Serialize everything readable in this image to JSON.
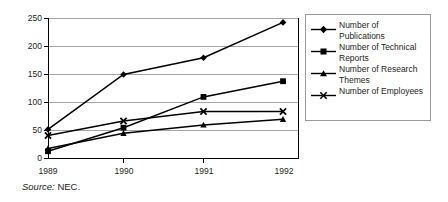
{
  "chart_data": {
    "type": "line",
    "title": "",
    "xlabel": "",
    "ylabel": "",
    "x": [
      "1989",
      "1990",
      "1991",
      "1992"
    ],
    "categories": [
      "1989",
      "1990",
      "1991",
      "1992"
    ],
    "ylim": [
      0,
      250
    ],
    "yticks": [
      0,
      50,
      100,
      150,
      200,
      250
    ],
    "ytick_labels": [
      "0",
      "50",
      "100",
      "150",
      "200",
      "250"
    ],
    "grid": "horizontal",
    "legend_position": "right",
    "series": [
      {
        "name": "Number of Publications",
        "marker": "diamond",
        "values": [
          52,
          150,
          180,
          243
        ]
      },
      {
        "name": "Number of Technical Reports",
        "marker": "square",
        "values": [
          13,
          55,
          110,
          138
        ]
      },
      {
        "name": "Number of Research Themes",
        "marker": "triangle",
        "values": [
          18,
          45,
          60,
          70
        ]
      },
      {
        "name": "Number of Employees",
        "marker": "cross",
        "values": [
          41,
          67,
          84,
          84
        ]
      }
    ],
    "colors": {
      "line": "#000000",
      "grid": "#a6a6a6",
      "axis": "#000000",
      "text": "#231f20"
    }
  },
  "legend": {
    "entries": [
      {
        "label_line1": "Number of",
        "label_line2": "Publications"
      },
      {
        "label_line1": "Number of Technical",
        "label_line2": "Reports"
      },
      {
        "label_line1": "Number of Research",
        "label_line2": "Themes"
      },
      {
        "label_line1": "Number of Employees",
        "label_line2": ""
      }
    ]
  },
  "source": {
    "prefix": "Source:",
    "value": "NEC."
  }
}
